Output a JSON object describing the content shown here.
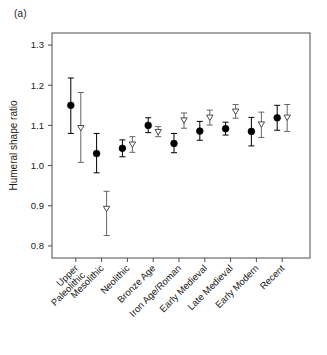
{
  "panel": {
    "label": "(a)"
  },
  "axes": {
    "y_title": "Humeral shape ratio",
    "y_ticks": [
      "0.8",
      "0.9",
      "1.0",
      "1.1",
      "1.2",
      "1.3"
    ],
    "x_title": ""
  },
  "chart_data": {
    "type": "scatter",
    "title": "",
    "subtitle": "",
    "xlabel": "",
    "ylabel": "Humeral shape ratio",
    "ylim": [
      0.77,
      1.33
    ],
    "yticks": [
      0.8,
      0.9,
      1.0,
      1.1,
      1.2,
      1.3
    ],
    "grid": false,
    "legend_position": "none",
    "error_bars": "vertical ranges (mean with confidence interval)",
    "categories": [
      "Upper Paleolithic",
      "Mesolithic",
      "Neolithic",
      "Bronze Age",
      "Iron Age/Roman",
      "Early Medieval",
      "Late Medieval",
      "Early Modern",
      "Recent"
    ],
    "series": [
      {
        "name": "filled-circle",
        "marker": "filled circle",
        "color": "#000000",
        "values": [
          1.15,
          1.03,
          1.043,
          1.1,
          1.055,
          1.086,
          1.092,
          1.085,
          1.119
        ],
        "lower": [
          1.08,
          0.982,
          1.022,
          1.082,
          1.032,
          1.063,
          1.076,
          1.049,
          1.088
        ],
        "upper": [
          1.218,
          1.08,
          1.064,
          1.119,
          1.08,
          1.11,
          1.108,
          1.12,
          1.15
        ]
      },
      {
        "name": "open-triangle",
        "marker": "open downward triangle",
        "color": "#666666",
        "values": [
          1.093,
          0.892,
          1.052,
          1.083,
          1.112,
          1.119,
          1.134,
          1.102,
          1.119
        ],
        "lower": [
          1.008,
          0.826,
          1.033,
          1.072,
          1.093,
          1.101,
          1.118,
          1.07,
          1.085
        ],
        "upper": [
          1.182,
          0.936,
          1.072,
          1.097,
          1.131,
          1.138,
          1.152,
          1.133,
          1.152
        ]
      }
    ]
  }
}
